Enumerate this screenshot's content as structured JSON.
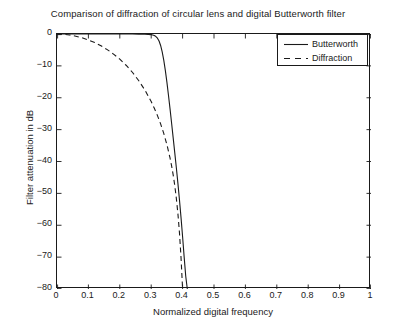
{
  "chart_data": {
    "type": "line",
    "title": "Comparison of diffraction of circular lens and digital Butterworth filter",
    "xlabel": "Normalized digital frequency",
    "ylabel": "Filter attenuation in dB",
    "xlim": [
      0,
      1
    ],
    "ylim": [
      -80,
      0
    ],
    "grid": false,
    "legend_position": "top-right",
    "xticks": [
      "0",
      "0.1",
      "0.2",
      "0.3",
      "0.4",
      "0.5",
      "0.6",
      "0.7",
      "0.8",
      "0.9",
      "1"
    ],
    "xtick_values": [
      0,
      0.1,
      0.2,
      0.3,
      0.4,
      0.5,
      0.6,
      0.7,
      0.8,
      0.9,
      1
    ],
    "yticks": [
      "0",
      "-10",
      "-20",
      "-30",
      "-40",
      "-50",
      "-60",
      "-70",
      "-80"
    ],
    "ytick_values": [
      0,
      -10,
      -20,
      -30,
      -40,
      -50,
      -60,
      -70,
      -80
    ],
    "series": [
      {
        "name": "Butterworth",
        "style": "solid",
        "color": "#1a1a1a",
        "x": [
          0,
          0.02,
          0.04,
          0.06,
          0.08,
          0.1,
          0.12,
          0.14,
          0.16,
          0.18,
          0.2,
          0.22,
          0.24,
          0.26,
          0.28,
          0.29,
          0.3,
          0.305,
          0.31,
          0.315,
          0.32,
          0.325,
          0.33,
          0.335,
          0.34,
          0.345,
          0.35,
          0.355,
          0.36,
          0.365,
          0.37,
          0.375,
          0.38,
          0.385,
          0.39,
          0.395,
          0.4,
          0.405,
          0.41,
          0.415
        ],
        "values": [
          0,
          0,
          0,
          0,
          0,
          0,
          0,
          0,
          0,
          0,
          -0.01,
          -0.01,
          -0.02,
          -0.04,
          -0.08,
          -0.12,
          -0.2,
          -0.3,
          -0.5,
          -0.8,
          -1.3,
          -2.2,
          -3.6,
          -5.6,
          -8.2,
          -11.4,
          -15.1,
          -19.2,
          -23.5,
          -28.0,
          -32.6,
          -37.2,
          -41.9,
          -46.8,
          -52.0,
          -57.6,
          -63.6,
          -70.0,
          -76.0,
          -80
        ]
      },
      {
        "name": "Diffraction",
        "style": "dashed",
        "color": "#1a1a1a",
        "x": [
          0,
          0.02,
          0.04,
          0.06,
          0.08,
          0.1,
          0.12,
          0.14,
          0.16,
          0.18,
          0.2,
          0.22,
          0.24,
          0.26,
          0.28,
          0.3,
          0.31,
          0.32,
          0.33,
          0.34,
          0.35,
          0.36,
          0.365,
          0.37,
          0.375,
          0.38,
          0.385,
          0.39,
          0.395,
          0.4
        ],
        "values": [
          0,
          -0.1,
          -0.3,
          -0.7,
          -1.2,
          -1.9,
          -2.7,
          -3.7,
          -4.9,
          -6.3,
          -7.9,
          -9.8,
          -12.0,
          -14.6,
          -17.6,
          -21.2,
          -23.3,
          -25.6,
          -28.2,
          -31.2,
          -34.7,
          -38.9,
          -41.4,
          -44.2,
          -47.5,
          -51.5,
          -56.3,
          -62.3,
          -70.2,
          -80
        ]
      }
    ]
  },
  "legend": {
    "entries": [
      {
        "label": "Butterworth"
      },
      {
        "label": "Diffraction"
      }
    ]
  }
}
